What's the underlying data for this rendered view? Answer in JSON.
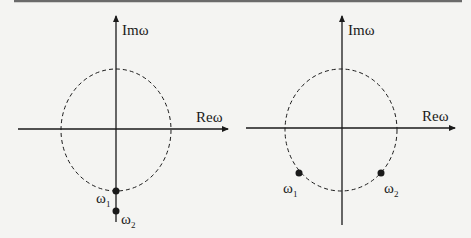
{
  "panels": [
    {
      "id": "left",
      "axis_labels": {
        "x": "Reω",
        "y": "Imω"
      },
      "circle": "unit circle (dashed)",
      "points": [
        {
          "label": "ω",
          "sub": "1",
          "position": "on circle, negative imaginary axis"
        },
        {
          "label": "ω",
          "sub": "2",
          "position": "outside circle, negative imaginary axis"
        }
      ]
    },
    {
      "id": "right",
      "axis_labels": {
        "x": "Reω",
        "y": "Imω"
      },
      "circle": "unit circle (dashed)",
      "points": [
        {
          "label": "ω",
          "sub": "1",
          "position": "on circle, third quadrant"
        },
        {
          "label": "ω",
          "sub": "2",
          "position": "on circle, fourth quadrant"
        }
      ]
    }
  ],
  "colors": {
    "ink": "#1a1a1a",
    "background": "#f4f4f2",
    "top_rule": "#6a6a6a"
  }
}
